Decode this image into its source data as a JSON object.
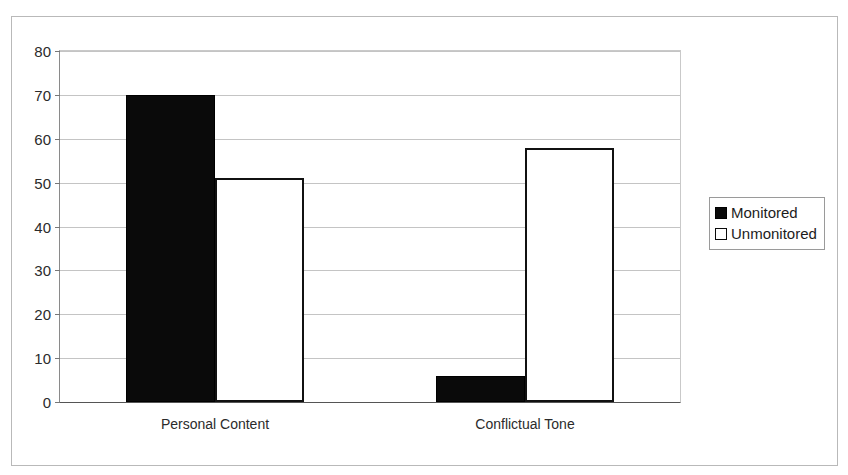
{
  "figure": {
    "title_partial": "",
    "frame": "plain-rectangle-border"
  },
  "chart_data": {
    "type": "bar",
    "title": "",
    "xlabel": "",
    "ylabel": "",
    "categories": [
      "Personal Content",
      "Conflictual Tone"
    ],
    "series": [
      {
        "name": "Monitored",
        "values": [
          70,
          6
        ],
        "color": "#000000",
        "fill": "solid-black"
      },
      {
        "name": "Unmonitored",
        "values": [
          51,
          58
        ],
        "color": "#ffffff",
        "fill": "white-with-black-outline"
      }
    ],
    "ylim": [
      0,
      80
    ],
    "ytick_labels": [
      "0",
      "10",
      "20",
      "30",
      "40",
      "50",
      "60",
      "70",
      "80"
    ],
    "ytick_values": [
      0,
      10,
      20,
      30,
      40,
      50,
      60,
      70,
      80
    ],
    "grid": true,
    "grid_axis": "y",
    "legend_position": "right-outside",
    "legend_entries": [
      "Monitored",
      "Unmonitored"
    ]
  },
  "legend": {
    "items": [
      {
        "label": "Monitored",
        "swatch": "filled"
      },
      {
        "label": "Unmonitored",
        "swatch": "hollow"
      }
    ]
  },
  "colors": {
    "monitored": "#000000",
    "unmonitored": "#ffffff",
    "gridline": "#c4c4c4",
    "axis": "#555555",
    "frame": "#b9b9b9",
    "text": "#2b2b2b"
  }
}
